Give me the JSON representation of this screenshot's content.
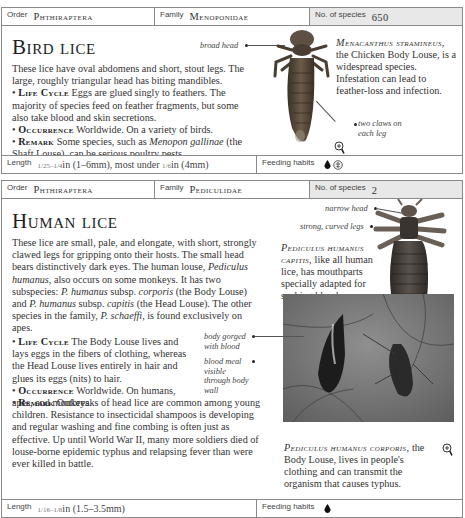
{
  "entries": [
    {
      "order_label": "Order",
      "order_value": "Phthiraptera",
      "family_label": "Family",
      "family_value": "Menoponidae",
      "species_label": "No. of species",
      "species_value": "650",
      "title": "Bird lice",
      "intro": "These lice have oval abdomens and short, stout legs. The large, roughly triangular head has biting mandibles.",
      "life_cycle_label": "Life Cycle",
      "life_cycle_text": "Eggs are glued singly to feathers. The majority of species feed on feather fragments, but some also take blood and skin secretions.",
      "occurrence_label": "Occurrence",
      "occurrence_text": "Worldwide. On a variety of birds.",
      "remark_label": "Remark",
      "remark_pre": "Some species, such as",
      "remark_italic": "Menopon gallinae",
      "remark_post": "(the Shaft Louse), can be serious poultry pests.",
      "annotations": {
        "broad_head": "broad head",
        "two_claws": "two claws on each leg"
      },
      "caption_species": "Menacanthus stramineus,",
      "caption_text": "the Chicken Body Louse, is a widespread species. Infestation can lead to feather-loss and infection.",
      "length_label": "Length",
      "length_frac": "1/25–1/4",
      "length_value": "in (1–6mm), most under",
      "length_frac2": "1/6",
      "length_value2": "in (4mm)",
      "feeding_label": "Feeding habits",
      "feeding_icons": [
        "blood-drop-icon",
        "feather-skin-icon"
      ]
    },
    {
      "order_label": "Order",
      "order_value": "Phthiraptera",
      "family_label": "Family",
      "family_value": "Pediculidae",
      "species_label": "No. of species",
      "species_value": "2",
      "title": "Human lice",
      "intro_1": "These lice are small, pale, and elongate, with short, strongly clawed legs for gripping onto their hosts. The small head bears distinctively dark eyes. The human louse,",
      "intro_italic_1": "Pediculus humanus,",
      "intro_2": "also occurs on some monkeys. It has two subspecies:",
      "intro_italic_2": "P. humanus",
      "intro_3": "subsp.",
      "intro_italic_3": "corporis",
      "intro_4": "(the Body Louse) and",
      "intro_italic_4": "P. humanus",
      "intro_5": "subsp.",
      "intro_italic_5": "capitis",
      "intro_6": "(the Head Louse). The other species in the family,",
      "intro_italic_6": "P. schaeffi,",
      "intro_7": "is found exclusively on apes.",
      "life_cycle_label": "Life Cycle",
      "life_cycle_text": "The Body Louse lives and lays eggs in the fibers of clothing, whereas the Head Louse lives entirely in hair and glues its eggs (nits) to hair.",
      "occurrence_label": "Occurrence",
      "occurrence_text": "Worldwide. On humans, apes, and monkeys.",
      "remark_label": "Remark",
      "remark_text": "Outbreaks of head lice are common among young children. Resistance to insecticidal shampoos is developing and regular washing and fine combing is often just as effective. Up until World War II, many more soldiers died of louse-borne epidemic typhus and relapsing fever than were ever killed in battle.",
      "annotations": {
        "narrow_head": "narrow head",
        "strong_legs": "strong, curved legs",
        "pear_shaped": "pear-shaped, flattened body",
        "body_gorged": "body gorged with blood",
        "blood_meal": "blood meal visible through body wall"
      },
      "caption1_species": "Pediculus humanus capitis,",
      "caption1_text": "like all human lice, has mouthparts specially adapted for sucking blood.",
      "caption2_species": "Pediculus humanus corporis,",
      "caption2_text": "the Body Louse, lives in people's clothing and can transmit the organism that causes typhus.",
      "length_label": "Length",
      "length_frac": "1/16–1/8",
      "length_value": "in (1.5–3.5mm)",
      "feeding_label": "Feeding habits",
      "feeding_icons": [
        "blood-drop-icon"
      ]
    }
  ]
}
